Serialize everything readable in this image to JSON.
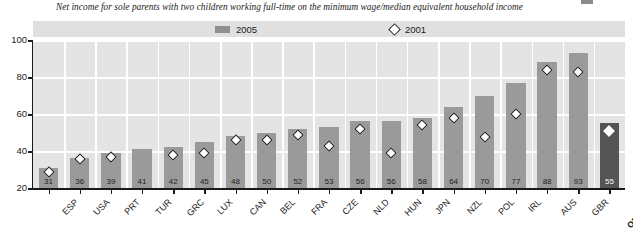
{
  "subtitle": "Net income for sole parents with two children working full-time on the minimum wage/median equivalent household income",
  "legend": {
    "series_2005_label": "2005",
    "series_2001_label": "2001",
    "bar_color": "#8f8f8f",
    "marker_color": "#ffffff",
    "marker_edge": "#2b2b2b"
  },
  "axis": {
    "y_ticks": [
      "20",
      "40",
      "60",
      "80",
      "100"
    ],
    "y_min": 20,
    "y_max": 100
  },
  "chart_data": {
    "type": "bar",
    "title": "",
    "subtitle": "Net income for sole parents with two children working full-time on the minimum wage/median equivalent household income",
    "xlabel": "",
    "ylabel": "",
    "ylim": [
      20,
      100
    ],
    "grid": true,
    "legend_position": "top",
    "categories": [
      "ESP",
      "USA",
      "PRT",
      "TUR",
      "GRC",
      "LUX",
      "CAN",
      "BEL",
      "FRA",
      "CZE",
      "NLD",
      "HUN",
      "JPN",
      "NZL",
      "POL",
      "IRL",
      "AUS",
      "GBR",
      "OECD18"
    ],
    "series": [
      {
        "name": "2005",
        "type": "bar",
        "values": [
          31,
          36,
          39,
          41,
          42,
          45,
          48,
          50,
          52,
          53,
          56,
          56,
          58,
          64,
          70,
          77,
          88,
          93,
          55
        ]
      },
      {
        "name": "2001",
        "type": "marker",
        "marker": "diamond",
        "values": [
          31,
          38,
          39,
          null,
          40,
          41,
          48,
          48,
          51,
          45,
          54,
          41,
          56,
          60,
          50,
          62,
          86,
          85,
          53
        ]
      }
    ],
    "data_labels": [
      "31",
      "36",
      "39",
      "41",
      "42",
      "45",
      "48",
      "50",
      "52",
      "53",
      "56",
      "56",
      "58",
      "64",
      "70",
      "77",
      "88",
      "93",
      "55"
    ],
    "highlight_category": "OECD18",
    "highlight_color": "#545454"
  }
}
